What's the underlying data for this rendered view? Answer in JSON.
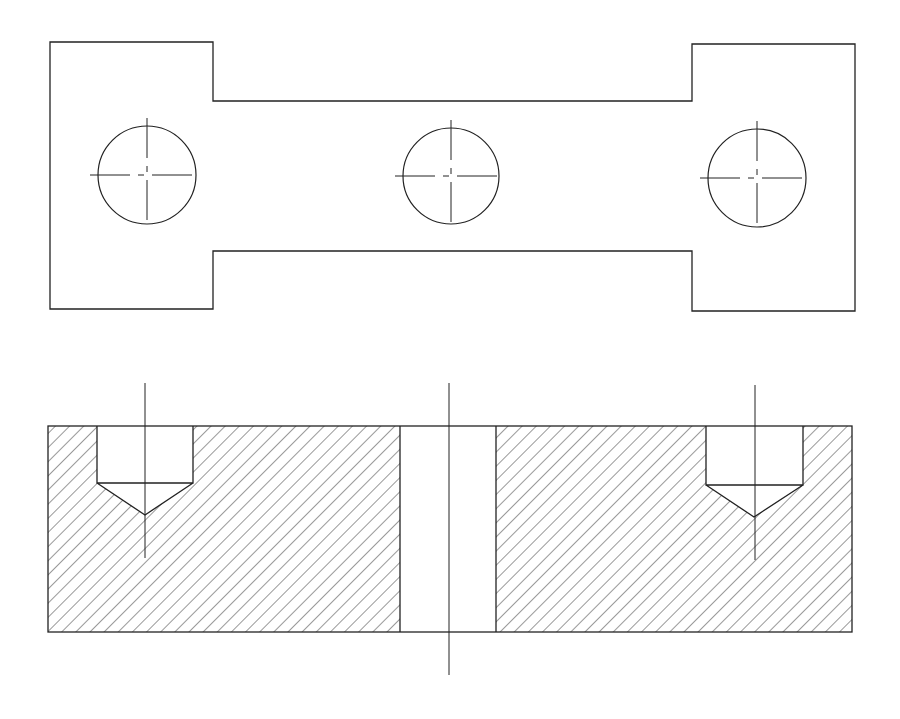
{
  "drawing": {
    "title": "",
    "stroke_color": "#222222",
    "background": "#ffffff",
    "top_view": {
      "outline_points": [
        [
          50,
          42
        ],
        [
          213,
          42
        ],
        [
          213,
          101
        ],
        [
          692,
          101
        ],
        [
          692,
          44
        ],
        [
          855,
          44
        ],
        [
          855,
          311
        ],
        [
          692,
          311
        ],
        [
          692,
          251
        ],
        [
          213,
          251
        ],
        [
          213,
          309
        ],
        [
          50,
          309
        ]
      ],
      "holes": [
        {
          "cx": 147,
          "cy": 175,
          "r": 49
        },
        {
          "cx": 451,
          "cy": 176,
          "r": 48
        },
        {
          "cx": 757,
          "cy": 178,
          "r": 49
        }
      ]
    },
    "section_view": {
      "outline": {
        "x": 48,
        "y": 426,
        "w": 804,
        "h": 206
      },
      "through_hole": {
        "x1": 400,
        "x2": 496,
        "axis_x": 449,
        "axis_top": 383,
        "axis_bottom": 675
      },
      "counterbores": [
        {
          "x1": 97,
          "x2": 193,
          "top": 426,
          "bottom": 483,
          "tip_x": 145,
          "tip_y": 515,
          "axis_x": 145,
          "axis_top": 383,
          "axis_bottom": 558
        },
        {
          "x1": 706,
          "x2": 803,
          "top": 426,
          "bottom": 485,
          "tip_x": 754,
          "tip_y": 517,
          "axis_x": 755,
          "axis_top": 385,
          "axis_bottom": 560
        }
      ],
      "hatch_spacing": 10
    }
  }
}
